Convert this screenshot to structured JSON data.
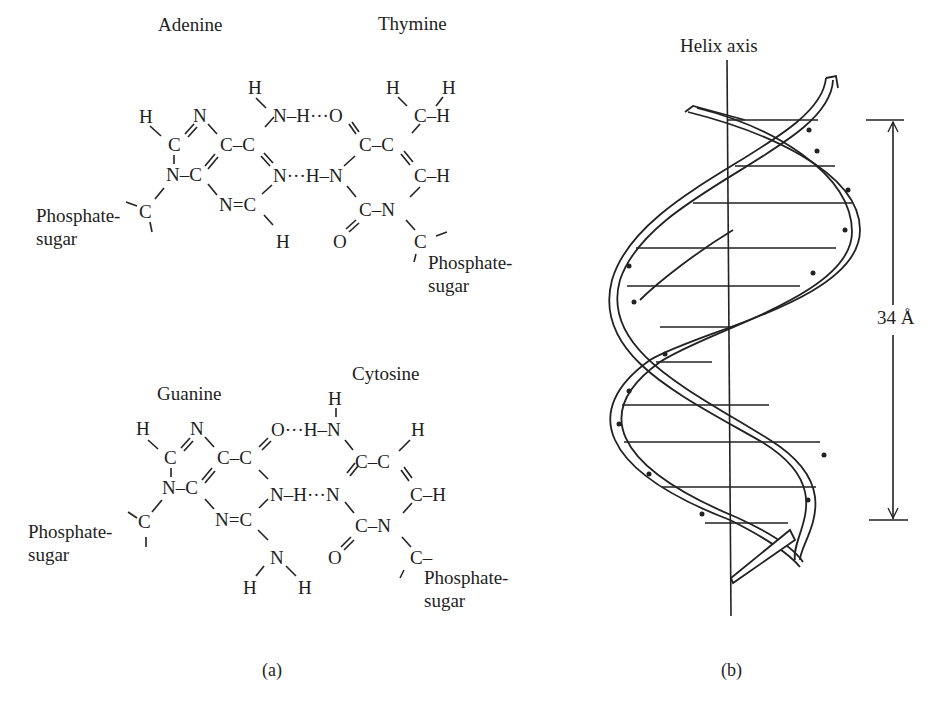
{
  "panel_a": {
    "caption": "(a)",
    "pair1": {
      "left_base": "Adenine",
      "right_base": "Thymine",
      "left_sugar": [
        "Phosphate-",
        "sugar"
      ],
      "right_sugar": [
        "Phosphate-",
        "sugar"
      ],
      "hbond1": "N–H···O",
      "hbond2": "N···H–N"
    },
    "pair2": {
      "left_base": "Guanine",
      "right_base": "Cytosine",
      "left_sugar": [
        "Phosphate-",
        "sugar"
      ],
      "right_sugar": [
        "Phosphate-",
        "sugar"
      ],
      "hbond1": "O···H–N",
      "hbond2": "N–H···N"
    }
  },
  "panel_b": {
    "caption": "(b)",
    "axis_label": "Helix axis",
    "pitch_label": "34 Å"
  }
}
